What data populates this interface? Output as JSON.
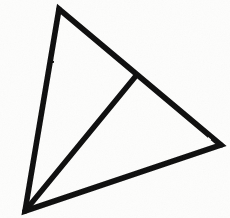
{
  "figure": {
    "title": "Triangle with internal cevian",
    "background_color": "#fdfdfc",
    "stroke_color": "#0d0d0d",
    "stroke_width": 5.5,
    "canvas": {
      "width": 230,
      "height": 218
    }
  },
  "chart_data": {
    "type": "diagram",
    "shape": "triangle-with-cevian",
    "title": "Triangle with internal cevian",
    "xlabel": "",
    "ylabel": "",
    "xlim": [
      0,
      230
    ],
    "ylim": [
      0,
      218
    ],
    "grid": false,
    "legend": "none",
    "vertices": [
      {
        "id": "A",
        "role": "top-apex",
        "x": 59,
        "y": 9
      },
      {
        "id": "B",
        "role": "bottom-left",
        "x": 25,
        "y": 211
      },
      {
        "id": "C",
        "role": "right",
        "x": 221,
        "y": 145
      },
      {
        "id": "D",
        "role": "cevian-foot-on-AC",
        "x": 135,
        "y": 77
      }
    ],
    "edges": [
      {
        "id": "AB",
        "from": "A",
        "to": "B",
        "kind": "outer-boundary"
      },
      {
        "id": "AC",
        "from": "A",
        "to": "C",
        "kind": "outer-boundary",
        "passes_through": "D"
      },
      {
        "id": "BC",
        "from": "B",
        "to": "C",
        "kind": "outer-boundary"
      },
      {
        "id": "BD",
        "from": "B",
        "to": "D",
        "kind": "interior-cevian"
      }
    ],
    "regions": [
      {
        "id": "ABD",
        "vertices": [
          "A",
          "B",
          "D"
        ],
        "fill": "none"
      },
      {
        "id": "BDC",
        "vertices": [
          "B",
          "D",
          "C"
        ],
        "fill": "none"
      }
    ],
    "outline_path": "M 59 9 L 25 211 L 221 145 Z",
    "cevian_path": "M 25 211 L 135 77"
  }
}
